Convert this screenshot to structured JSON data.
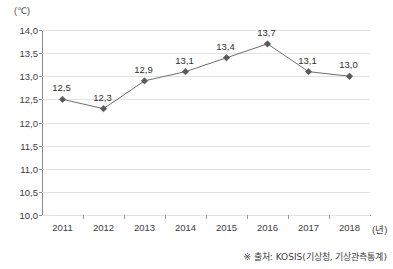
{
  "chart_data": {
    "type": "line",
    "title": "",
    "xlabel": "(년)",
    "ylabel": "(℃)",
    "categories": [
      "2011",
      "2012",
      "2013",
      "2014",
      "2015",
      "2016",
      "2017",
      "2018"
    ],
    "values": [
      12.5,
      12.3,
      12.9,
      13.1,
      13.4,
      13.7,
      13.1,
      13.0
    ],
    "point_labels": [
      "12,5",
      "12,3",
      "12,9",
      "13,1",
      "13,4",
      "13,7",
      "13,1",
      "13,0"
    ],
    "ylim": [
      10.0,
      14.0
    ],
    "ytick_values": [
      14.0,
      13.5,
      13.0,
      12.5,
      12.0,
      11.5,
      11.0,
      10.5,
      10.0
    ],
    "ytick_labels": [
      "14,0",
      "13,5",
      "13,0",
      "12,5",
      "12,0",
      "11,5",
      "11,0",
      "10,5",
      "10,0"
    ],
    "grid": true,
    "legend": "none",
    "series_color": "#6f6f6f",
    "marker_color": "#5a5a5a",
    "marker_shape": "diamond",
    "grid_color": "#e2e2e2",
    "axis_color": "#8d8d8d"
  },
  "footer": {
    "source_note": "※ 출처: KOSIS(기상청, 기상관측통계)"
  }
}
